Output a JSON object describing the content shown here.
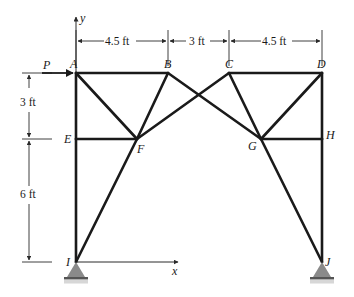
{
  "diagram": {
    "type": "truss",
    "axes": {
      "x_label": "x",
      "y_label": "y"
    },
    "load": {
      "label": "P",
      "joint": "A",
      "direction": "right"
    },
    "joints": [
      {
        "id": "A",
        "label": "A",
        "x": 76,
        "y": 73
      },
      {
        "id": "B",
        "label": "B",
        "x": 168,
        "y": 73
      },
      {
        "id": "C",
        "label": "C",
        "x": 229,
        "y": 73
      },
      {
        "id": "D",
        "label": "D",
        "x": 322,
        "y": 73
      },
      {
        "id": "E",
        "label": "E",
        "x": 76,
        "y": 139
      },
      {
        "id": "F",
        "label": "F",
        "x": 137,
        "y": 139
      },
      {
        "id": "G",
        "label": "G",
        "x": 261,
        "y": 139
      },
      {
        "id": "H",
        "label": "H",
        "x": 322,
        "y": 139
      },
      {
        "id": "I",
        "label": "I",
        "x": 76,
        "y": 262
      },
      {
        "id": "J",
        "label": "J",
        "x": 322,
        "y": 262
      }
    ],
    "members": [
      "AB",
      "CD",
      "AE",
      "EI",
      "DH",
      "HJ",
      "AF",
      "BF",
      "EF",
      "BG",
      "CF",
      "CG",
      "DG",
      "GH",
      "FI",
      "GJ"
    ],
    "supports": [
      {
        "joint": "I",
        "type": "pin"
      },
      {
        "joint": "J",
        "type": "pin"
      }
    ],
    "dimensions": {
      "horizontal": [
        {
          "label": "4.5 ft",
          "from": "A",
          "to": "B"
        },
        {
          "label": "3 ft",
          "from": "B",
          "to": "C"
        },
        {
          "label": "4.5 ft",
          "from": "C",
          "to": "D"
        }
      ],
      "vertical": [
        {
          "label": "3 ft",
          "from": "A",
          "to": "E"
        },
        {
          "label": "6 ft",
          "from": "E",
          "to": "I"
        }
      ]
    }
  }
}
